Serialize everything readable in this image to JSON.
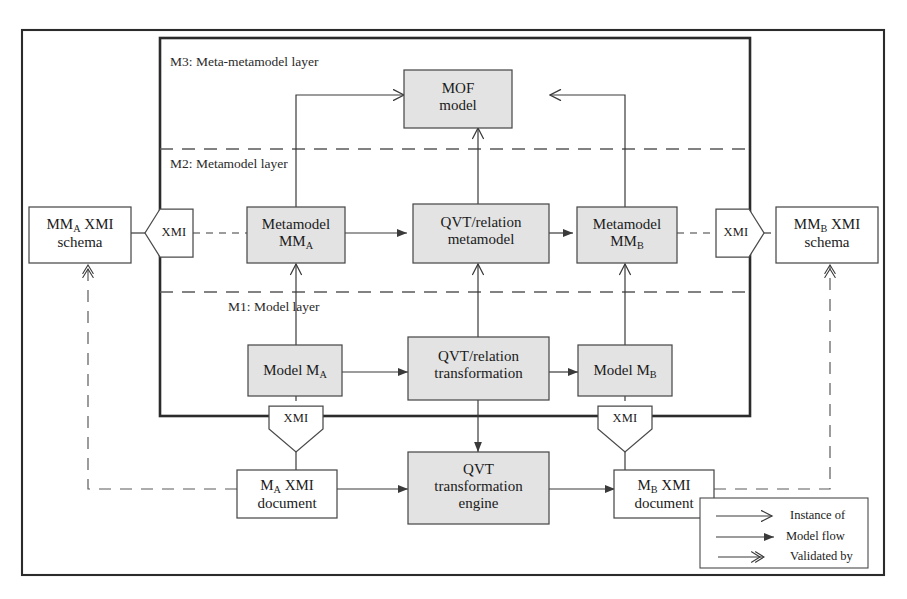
{
  "diagram": {
    "layers": [
      {
        "id": "m3",
        "label": "M3: Meta-metamodel layer"
      },
      {
        "id": "m2",
        "label": "M2: Metamodel layer"
      },
      {
        "id": "m1",
        "label": "M1: Model layer"
      }
    ],
    "boxes": [
      {
        "id": "mof-model",
        "line1": "MOF",
        "line2": "model",
        "fill": "#e3e3e3"
      },
      {
        "id": "mma-xmi-schema",
        "line1": "MM<sub>A</sub> XMI",
        "line2": "schema",
        "fill": "#ffffff"
      },
      {
        "id": "metamodel-mma",
        "line1": "Metamodel",
        "line2": "MM<sub>A</sub>",
        "fill": "#e3e3e3"
      },
      {
        "id": "qvt-relation-metamodel",
        "line1": "QVT/relation",
        "line2": "metamodel",
        "fill": "#e3e3e3"
      },
      {
        "id": "metamodel-mmb",
        "line1": "Metamodel",
        "line2": "MM<sub>B</sub>",
        "fill": "#e3e3e3"
      },
      {
        "id": "mmb-xmi-schema",
        "line1": "MM<sub>B</sub> XMI",
        "line2": "schema",
        "fill": "#ffffff"
      },
      {
        "id": "model-ma",
        "line1": "Model M<sub>A</sub>",
        "line2": "",
        "fill": "#e3e3e3"
      },
      {
        "id": "qvt-relation-transformation",
        "line1": "QVT/relation",
        "line2": "transformation",
        "fill": "#e3e3e3"
      },
      {
        "id": "model-mb",
        "line1": "Model M<sub>B</sub>",
        "line2": "",
        "fill": "#e3e3e3"
      },
      {
        "id": "ma-xmi-document",
        "line1": "M<sub>A</sub> XMI",
        "line2": "document",
        "fill": "#ffffff"
      },
      {
        "id": "qvt-transformation-engine",
        "line1": "QVT",
        "line2": "transformation",
        "line3": "engine",
        "fill": "#e3e3e3"
      },
      {
        "id": "mb-xmi-document",
        "line1": "M<sub>B</sub> XMI",
        "line2": "document",
        "fill": "#ffffff"
      }
    ],
    "markers": [
      {
        "id": "xmi-left",
        "label": "XMI",
        "direction": "left"
      },
      {
        "id": "xmi-right",
        "label": "XMI",
        "direction": "right"
      },
      {
        "id": "xmi-ma",
        "label": "XMI",
        "direction": "down"
      },
      {
        "id": "xmi-mb",
        "label": "XMI",
        "direction": "down"
      }
    ],
    "legend": [
      {
        "id": "instance-of",
        "label": "Instance of",
        "arrow": "open"
      },
      {
        "id": "model-flow",
        "label": "Model flow",
        "arrow": "filled"
      },
      {
        "id": "validated-by",
        "label": "Validated by",
        "arrow": "double"
      }
    ],
    "colors": {
      "line": "#3a3a3a",
      "box_border": "#4a4a4a",
      "box_fill_gray": "#e3e3e3",
      "box_fill_white": "#ffffff",
      "frame": "#2b2b2b",
      "background": "#ffffff"
    }
  }
}
